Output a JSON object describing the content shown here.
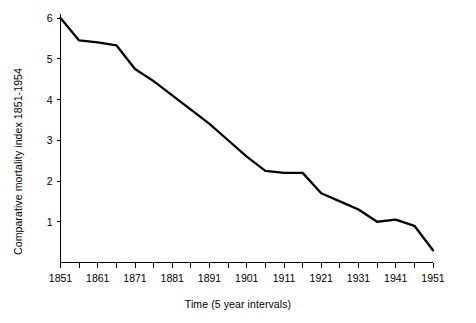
{
  "chart_data": {
    "type": "line",
    "title": "",
    "xlabel": "Time (5 year intervals)",
    "ylabel": "Comparative mortality index 1851-1954",
    "xlim": [
      1851,
      1951
    ],
    "ylim": [
      0,
      6
    ],
    "grid": false,
    "legend": false,
    "line_color": "#000000",
    "background_color": "#ffffff",
    "x_major_ticklabels": [
      "1851",
      "1861",
      "1871",
      "1881",
      "1891",
      "1901",
      "1911",
      "1921",
      "1931",
      "1941",
      "1951"
    ],
    "x_minor_interval_years": 5,
    "y_ticklabels": [
      "1",
      "2",
      "3",
      "4",
      "5",
      "6"
    ],
    "x": [
      1851,
      1856,
      1861,
      1866,
      1871,
      1876,
      1881,
      1886,
      1891,
      1896,
      1901,
      1906,
      1911,
      1916,
      1921,
      1926,
      1931,
      1936,
      1941,
      1946,
      1951
    ],
    "values": [
      6.0,
      5.45,
      5.4,
      5.33,
      4.75,
      4.45,
      4.1,
      3.75,
      3.4,
      3.0,
      2.6,
      2.25,
      2.2,
      2.2,
      1.7,
      1.5,
      1.3,
      1.0,
      1.05,
      0.9,
      0.3
    ],
    "series": [
      {
        "name": "Comparative mortality index",
        "values": [
          6.0,
          5.45,
          5.4,
          5.33,
          4.75,
          4.45,
          4.1,
          3.75,
          3.4,
          3.0,
          2.6,
          2.25,
          2.2,
          2.2,
          1.7,
          1.5,
          1.3,
          1.0,
          1.05,
          0.9,
          0.3
        ]
      }
    ]
  },
  "axis": {
    "y_label_text": "Comparative mortality index 1851-1954",
    "x_label_text": "Time (5 year intervals)"
  }
}
